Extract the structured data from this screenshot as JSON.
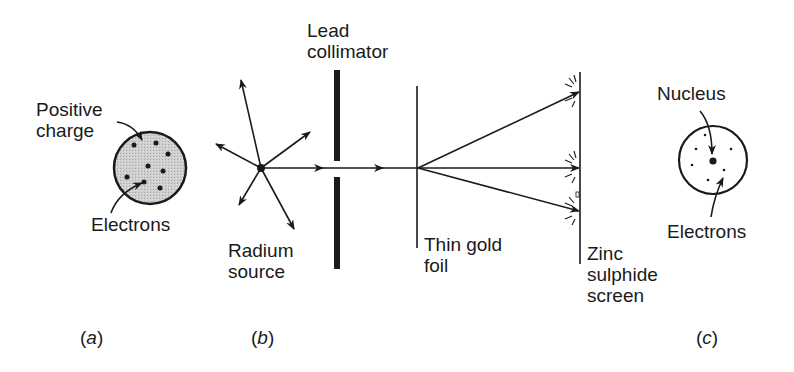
{
  "diagram": {
    "panels": {
      "a": {
        "caption": "(a)",
        "caption_letter": "a",
        "labels": {
          "positive_charge": "Positive\ncharge",
          "electrons": "Electrons"
        }
      },
      "b": {
        "caption": "(b)",
        "caption_letter": "b",
        "labels": {
          "lead_collimator": "Lead\ncollimator",
          "radium_source": "Radium\nsource",
          "thin_gold_foil": "Thin gold\nfoil",
          "zinc_sulphide_screen": "Zinc\nsulphide\nscreen"
        }
      },
      "c": {
        "caption": "(c)",
        "caption_letter": "c",
        "labels": {
          "nucleus": "Nucleus",
          "electrons": "Electrons"
        }
      }
    },
    "colors": {
      "ink": "#1a1a1a",
      "sphere_fill": "#c8c8c8",
      "background": "#ffffff"
    }
  }
}
